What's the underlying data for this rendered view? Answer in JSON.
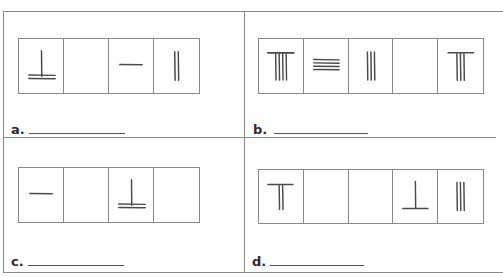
{
  "worksheet": {
    "clipped_header": "· · · · ·",
    "problems": [
      {
        "id": "a",
        "label": "a.",
        "answer": "",
        "cells": [
          {
            "glyph": "one-vertical-two-horizontal-base",
            "description": "1 vertical rod over 2 horizontal rods"
          },
          {
            "glyph": "empty",
            "description": "empty"
          },
          {
            "glyph": "one-horizontal",
            "description": "1 horizontal rod"
          },
          {
            "glyph": "two-vertical",
            "description": "2 vertical rods"
          }
        ]
      },
      {
        "id": "b",
        "label": "b.",
        "answer": "",
        "cells": [
          {
            "glyph": "four-vertical-top-bar",
            "description": "horizontal top bar over 4 vertical rods"
          },
          {
            "glyph": "four-horizontal",
            "description": "4 horizontal rods"
          },
          {
            "glyph": "three-vertical",
            "description": "3 vertical rods"
          },
          {
            "glyph": "empty",
            "description": "empty"
          },
          {
            "glyph": "three-vertical-top-bar",
            "description": "horizontal top bar over 3 vertical rods"
          }
        ]
      },
      {
        "id": "c",
        "label": "c.",
        "answer": "",
        "cells": [
          {
            "glyph": "one-horizontal",
            "description": "1 horizontal rod"
          },
          {
            "glyph": "empty",
            "description": "empty"
          },
          {
            "glyph": "one-vertical-two-horizontal-base",
            "description": "1 vertical rod over 2 horizontal rods"
          },
          {
            "glyph": "empty",
            "description": "empty"
          }
        ]
      },
      {
        "id": "d",
        "label": "d.",
        "answer": "",
        "cells": [
          {
            "glyph": "two-vertical-top-bar",
            "description": "horizontal top bar over 2 vertical rods"
          },
          {
            "glyph": "empty",
            "description": "empty"
          },
          {
            "glyph": "empty",
            "description": "empty"
          },
          {
            "glyph": "one-vertical-one-horizontal-base",
            "description": "1 vertical rod over 1 horizontal rod"
          },
          {
            "glyph": "three-vertical",
            "description": "3 vertical rods"
          }
        ]
      }
    ]
  },
  "colors": {
    "border": "#8a8a8a",
    "rod": "#4a4a4a",
    "text": "#2a2a2a"
  }
}
